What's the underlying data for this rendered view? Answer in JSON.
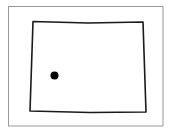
{
  "map": {
    "region": "Wyoming",
    "frame": {
      "x": 8.5,
      "y": 6.5,
      "width": 154.5,
      "height": 119.5,
      "stroke": "#9a9a9a"
    },
    "outline": {
      "points": "33,21.5 88,23 143,22 146,112 90,112.5 30,111",
      "stroke": "#1a1a1a",
      "fill": "#ffffff"
    },
    "marker": {
      "cx": 54.5,
      "cy": 75.5,
      "r": 4,
      "fill": "#000000"
    }
  }
}
